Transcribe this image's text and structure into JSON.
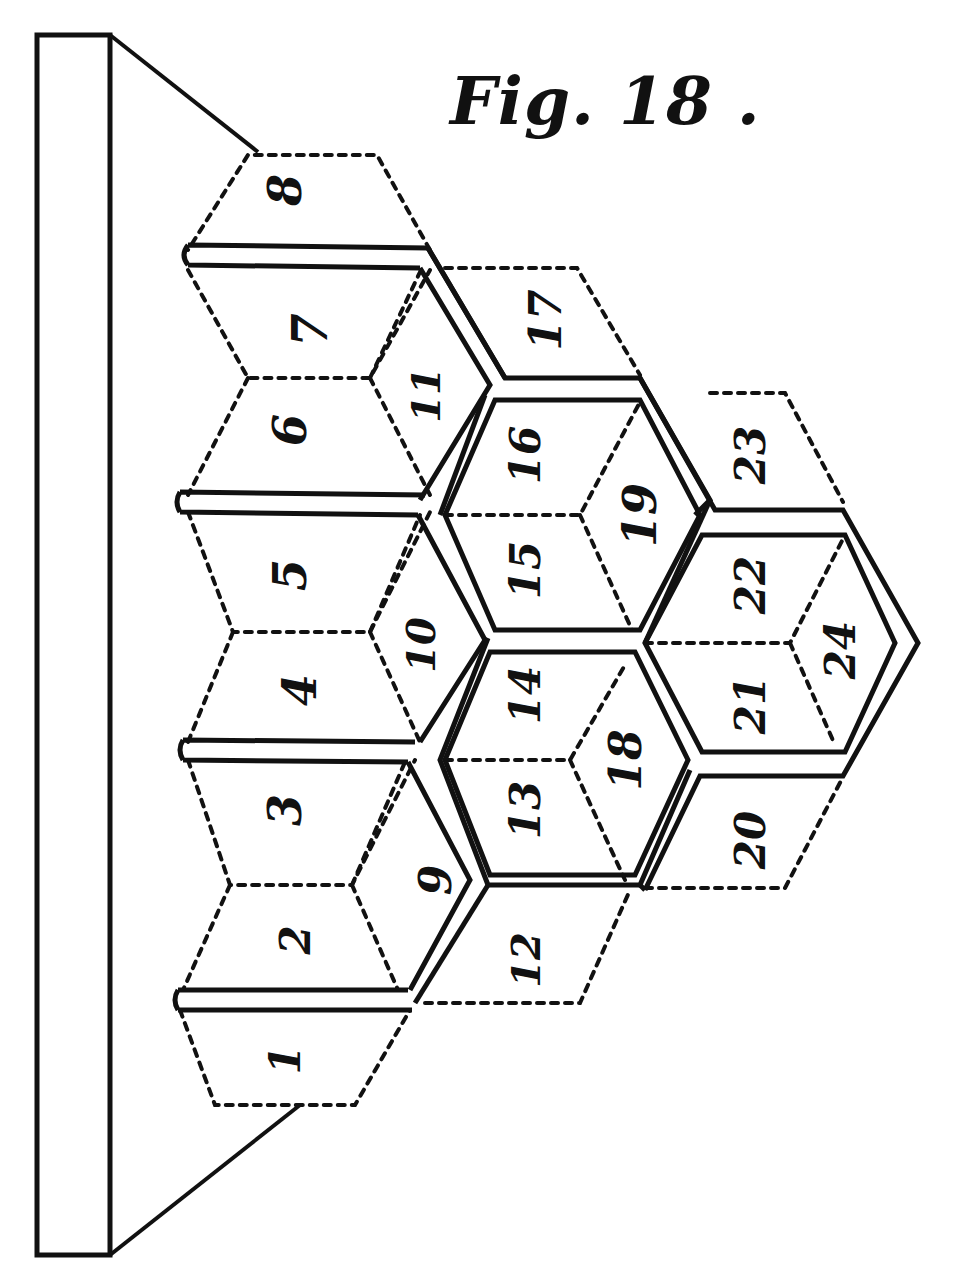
{
  "figure": {
    "title": "Fig. 18 .",
    "tiles": [
      {
        "id": 1,
        "label": "1",
        "x": 285,
        "y": 1060
      },
      {
        "id": 2,
        "label": "2",
        "x": 295,
        "y": 940
      },
      {
        "id": 3,
        "label": "3",
        "x": 285,
        "y": 810
      },
      {
        "id": 4,
        "label": "4",
        "x": 300,
        "y": 690
      },
      {
        "id": 5,
        "label": "5",
        "x": 290,
        "y": 575
      },
      {
        "id": 6,
        "label": "6",
        "x": 290,
        "y": 430
      },
      {
        "id": 7,
        "label": "7",
        "x": 310,
        "y": 330
      },
      {
        "id": 8,
        "label": "8",
        "x": 285,
        "y": 190
      },
      {
        "id": 9,
        "label": "9",
        "x": 435,
        "y": 880
      },
      {
        "id": 10,
        "label": "10",
        "x": 420,
        "y": 645
      },
      {
        "id": 11,
        "label": "11",
        "x": 425,
        "y": 395
      },
      {
        "id": 12,
        "label": "12",
        "x": 525,
        "y": 960
      },
      {
        "id": 13,
        "label": "13",
        "x": 525,
        "y": 810
      },
      {
        "id": 14,
        "label": "14",
        "x": 525,
        "y": 695
      },
      {
        "id": 15,
        "label": "15",
        "x": 525,
        "y": 570
      },
      {
        "id": 16,
        "label": "16",
        "x": 525,
        "y": 455
      },
      {
        "id": 17,
        "label": "17",
        "x": 545,
        "y": 320
      },
      {
        "id": 18,
        "label": "18",
        "x": 625,
        "y": 760
      },
      {
        "id": 19,
        "label": "19",
        "x": 640,
        "y": 515
      },
      {
        "id": 20,
        "label": "20",
        "x": 750,
        "y": 840
      },
      {
        "id": 21,
        "label": "21",
        "x": 750,
        "y": 705
      },
      {
        "id": 22,
        "label": "22",
        "x": 750,
        "y": 585
      },
      {
        "id": 23,
        "label": "23",
        "x": 750,
        "y": 455
      },
      {
        "id": 24,
        "label": "24",
        "x": 840,
        "y": 650
      }
    ]
  }
}
